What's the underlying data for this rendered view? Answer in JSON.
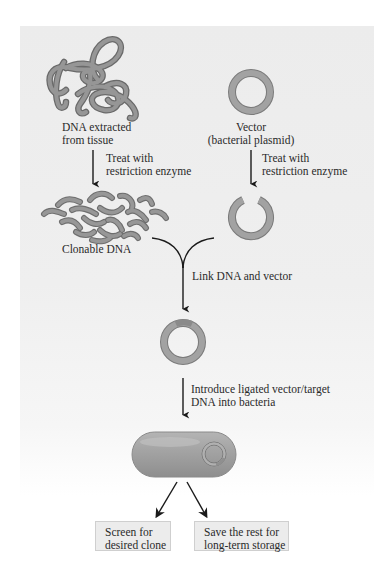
{
  "figure": {
    "colors": {
      "panel_background": "#ececec",
      "dna_strand": "#8f8f8f",
      "dna_strand_edge": "#6a6a6a",
      "arrow": "#1a1a1a",
      "box_background": "#ececec",
      "box_border": "#cfcfcf",
      "text": "#2a2a2a"
    },
    "step1": {
      "source_label_line1": "DNA extracted",
      "source_label_line2": "from tissue",
      "vector_label_line1": "Vector",
      "vector_label_line2": "(bacterial plasmid)"
    },
    "step2": {
      "left_action_line1": "Treat with",
      "left_action_line2": "restriction enzyme",
      "right_action_line1": "Treat with",
      "right_action_line2": "restriction enzyme"
    },
    "step3": {
      "fragments_label": "Clonable DNA"
    },
    "step4": {
      "link_action": "Link DNA and vector"
    },
    "step5": {
      "introduce_action_line1": "Introduce ligated vector/target",
      "introduce_action_line2": "DNA into bacteria"
    },
    "outcomes": [
      {
        "line1": "Screen for",
        "line2": "desired clone"
      },
      {
        "line1": "Save the rest for",
        "line2": "long-term storage"
      }
    ]
  }
}
